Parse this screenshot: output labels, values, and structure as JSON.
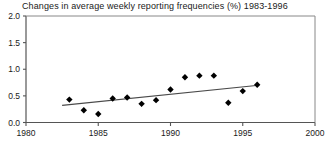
{
  "chart_data": {
    "type": "scatter",
    "title": "Changes in average weekly reporting frequencies (%) 1983-1996",
    "xlabel": "",
    "ylabel": "",
    "xlim": [
      1980,
      2000
    ],
    "ylim": [
      0.0,
      2.0
    ],
    "xticks": [
      1980,
      1985,
      1990,
      1995,
      2000
    ],
    "xtick_labels": [
      "1980",
      "1985",
      "1990",
      "1995",
      "2000"
    ],
    "yticks": [
      0.0,
      0.5,
      1.0,
      1.5,
      2.0
    ],
    "ytick_labels": [
      "0.0",
      "0.5",
      "1.0",
      "1.5",
      "2.0"
    ],
    "grid": false,
    "legend": "none",
    "marker": "diamond",
    "marker_color": "#000000",
    "series": [
      {
        "name": "Change in average weekly reporting frequency",
        "x": [
          1983,
          1984,
          1985,
          1986,
          1987,
          1988,
          1989,
          1990,
          1991,
          1992,
          1993,
          1994,
          1995,
          1996
        ],
        "values": [
          0.43,
          0.23,
          0.16,
          0.45,
          0.47,
          0.35,
          0.42,
          0.62,
          0.85,
          0.88,
          0.88,
          0.37,
          0.59,
          0.71
        ]
      }
    ],
    "trendline": {
      "type": "linear",
      "x": [
        1982.5,
        1996.1
      ],
      "y": [
        0.32,
        0.7
      ],
      "color": "#4a4a4a"
    }
  }
}
